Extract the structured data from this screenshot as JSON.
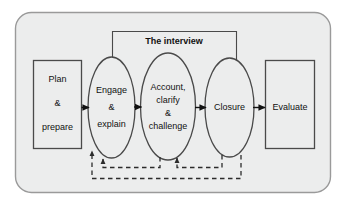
{
  "diagram": {
    "title_label": "The interview",
    "background_color": "#ffffff",
    "panel_color": "#eceded",
    "panel_border_color": "#9a9a9a",
    "shape_fill_color": "#eceded",
    "shape_stroke_color": "#4a4a4a",
    "arrow_color": "#111111",
    "dashed_color": "#2b2b2b",
    "nodes": [
      {
        "id": "plan-prepare",
        "shape": "rectangle",
        "lines": [
          "Plan",
          "&",
          "prepare"
        ]
      },
      {
        "id": "engage-explain",
        "shape": "ellipse",
        "lines": [
          "Engage",
          "&",
          "explain"
        ]
      },
      {
        "id": "account-clarify-challenge",
        "shape": "ellipse",
        "lines": [
          "Account,",
          "clarify",
          "&",
          "challenge"
        ]
      },
      {
        "id": "closure",
        "shape": "ellipse",
        "lines": [
          "Closure"
        ]
      },
      {
        "id": "evaluate",
        "shape": "rectangle",
        "lines": [
          "Evaluate"
        ]
      }
    ],
    "flow_arrows": [
      {
        "from": "plan-prepare",
        "to": "engage-explain"
      },
      {
        "from": "engage-explain",
        "to": "account-clarify-challenge"
      },
      {
        "from": "account-clarify-challenge",
        "to": "closure"
      },
      {
        "from": "closure",
        "to": "evaluate"
      }
    ],
    "feedback_arrows": [
      {
        "from": "account-clarify-challenge",
        "to": "engage-explain",
        "style": "dashed"
      },
      {
        "from": "closure",
        "to": "account-clarify-challenge",
        "style": "dashed"
      },
      {
        "from": "closure",
        "to": "engage-explain",
        "style": "dashed"
      }
    ]
  }
}
